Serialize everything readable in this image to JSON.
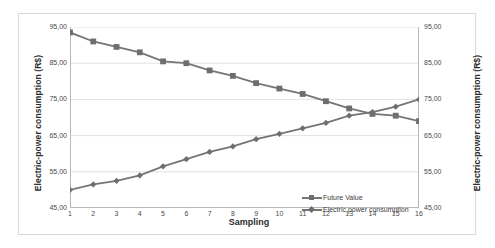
{
  "chart_data": {
    "type": "line",
    "title": "",
    "xlabel": "Sampling",
    "ylabel": "Electric-power consumption (R$)",
    "ylabel_right": "Electric-power consumption (R$)",
    "x": [
      1,
      2,
      3,
      4,
      5,
      6,
      7,
      8,
      9,
      10,
      11,
      12,
      13,
      14,
      15,
      16
    ],
    "xtick_labels": [
      "1",
      "2",
      "3",
      "4",
      "5",
      "6",
      "7",
      "8",
      "9",
      "10",
      "11",
      "12",
      "13",
      "14",
      "15",
      "16"
    ],
    "ytick_labels": [
      "95,00",
      "85,00",
      "75,00",
      "65,00",
      "55,00",
      "45,00"
    ],
    "ytick_values": [
      95,
      85,
      75,
      65,
      55,
      45
    ],
    "ylim": [
      45,
      95
    ],
    "xlim": [
      1,
      16
    ],
    "grid": "horizontal",
    "legend_position": "bottom-right",
    "series": [
      {
        "name": "Future Value",
        "marker": "square",
        "color": "#757575",
        "values": [
          93.5,
          91.0,
          89.5,
          88.0,
          85.5,
          85.0,
          83.0,
          81.5,
          79.5,
          78.0,
          76.5,
          74.5,
          72.5,
          71.0,
          70.5,
          69.0
        ]
      },
      {
        "name": "Electric power consumption",
        "marker": "diamond",
        "color": "#757575",
        "values": [
          50.0,
          51.5,
          52.5,
          54.0,
          56.5,
          58.5,
          60.5,
          62.0,
          64.0,
          65.5,
          67.0,
          68.5,
          70.5,
          71.5,
          73.0,
          75.0
        ]
      }
    ]
  },
  "legend": {
    "items": [
      {
        "label": "Future Value",
        "marker": "square"
      },
      {
        "label": "Electric power consumption",
        "marker": "diamond"
      }
    ]
  },
  "colors": {
    "series": "#757575",
    "marker": "#6e6e6e",
    "grid": "#e2e2e2",
    "axis": "#b8b8b8",
    "border": "#d9d9d9",
    "text": "#4a4a4a"
  }
}
